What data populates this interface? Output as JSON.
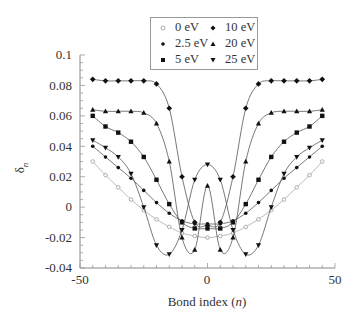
{
  "chart_data": {
    "type": "line",
    "title": "",
    "xlabel": "Bond index (n)",
    "xlabel_main": "Bond index (",
    "xlabel_var": "n",
    "xlabel_close": ")",
    "ylabel": "δn",
    "ylabel_main": "δ",
    "ylabel_sub": "n",
    "xlim": [
      -50,
      50
    ],
    "ylim": [
      -0.04,
      0.1
    ],
    "xticks": [
      "-50",
      "0",
      "50"
    ],
    "yticks": [
      "-0.04",
      "-0.02",
      "0",
      "0.02",
      "0.04",
      "0.06",
      "0.08",
      "0.1"
    ],
    "grid": false,
    "legend_position": "top-center",
    "x": [
      -45,
      -40,
      -35,
      -30,
      -25,
      -20,
      -15,
      -10,
      -5,
      0,
      5,
      10,
      15,
      20,
      25,
      30,
      35,
      40,
      45
    ],
    "series": [
      {
        "name": "0 eV",
        "marker": "open-circle",
        "color": "#999999",
        "values": [
          0.03,
          0.021,
          0.013,
          0.005,
          -0.002,
          -0.008,
          -0.013,
          -0.017,
          -0.019,
          -0.02,
          -0.019,
          -0.017,
          -0.013,
          -0.008,
          -0.002,
          0.005,
          0.013,
          0.021,
          0.03
        ]
      },
      {
        "name": "2.5 eV",
        "marker": "small-circle",
        "color": "#111111",
        "values": [
          0.04,
          0.033,
          0.026,
          0.019,
          0.011,
          0.003,
          -0.004,
          -0.009,
          -0.011,
          -0.011,
          -0.011,
          -0.009,
          -0.004,
          0.003,
          0.011,
          0.019,
          0.026,
          0.033,
          0.04
        ]
      },
      {
        "name": "5 eV",
        "marker": "square",
        "color": "#111111",
        "values": [
          0.06,
          0.053,
          0.049,
          0.043,
          0.033,
          0.018,
          0.002,
          -0.01,
          -0.014,
          -0.014,
          -0.014,
          -0.01,
          0.002,
          0.018,
          0.033,
          0.043,
          0.049,
          0.053,
          0.06
        ]
      },
      {
        "name": "10 eV",
        "marker": "diamond",
        "color": "#111111",
        "values": [
          0.084,
          0.083,
          0.083,
          0.083,
          0.083,
          0.081,
          0.065,
          0.02,
          -0.01,
          -0.012,
          -0.01,
          0.02,
          0.065,
          0.081,
          0.083,
          0.083,
          0.083,
          0.083,
          0.084
        ]
      },
      {
        "name": "20 eV",
        "marker": "triangle-up",
        "color": "#111111",
        "values": [
          0.064,
          0.063,
          0.063,
          0.063,
          0.062,
          0.055,
          0.03,
          -0.02,
          -0.028,
          0.014,
          -0.028,
          -0.02,
          0.03,
          0.055,
          0.062,
          0.063,
          0.063,
          0.063,
          0.064
        ]
      },
      {
        "name": "25 eV",
        "marker": "triangle-down",
        "color": "#111111",
        "values": [
          0.044,
          0.039,
          0.033,
          0.022,
          0.0,
          -0.025,
          -0.031,
          -0.015,
          0.018,
          0.028,
          0.018,
          -0.015,
          -0.031,
          -0.025,
          0.0,
          0.022,
          0.033,
          0.039,
          0.044
        ]
      }
    ]
  },
  "legend": {
    "items": [
      "0 eV",
      "2.5 eV",
      "5 eV",
      "10 eV",
      "20 eV",
      "25 eV"
    ]
  }
}
